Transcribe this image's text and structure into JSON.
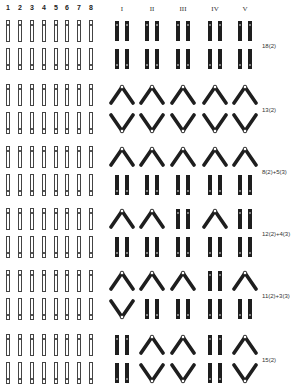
{
  "header": {
    "left_columns": [
      "1",
      "2",
      "3",
      "4",
      "5",
      "6",
      "7",
      "8"
    ],
    "right_columns": [
      "I",
      "II",
      "III",
      "IV",
      "V"
    ]
  },
  "groups": [
    {
      "label": "18(2)",
      "top": [
        "II",
        "II",
        "II",
        "II",
        "II"
      ],
      "bottom": [
        "II",
        "II",
        "II",
        "II",
        "II"
      ],
      "centromere_top": "top",
      "centromere_bottom": "bottom"
    },
    {
      "label": "13(2)",
      "top": [
        "^",
        "^",
        "^",
        "^",
        "^"
      ],
      "bottom": [
        "v",
        "v",
        "v",
        "v",
        "v"
      ],
      "centromere_top": "top",
      "centromere_bottom": "bottom"
    },
    {
      "label": "8(2)+5(3)",
      "top": [
        "^",
        "^",
        "^",
        "^",
        "^"
      ],
      "bottom": [
        "II",
        "II",
        "II",
        "II",
        "II"
      ],
      "centromere_top": "top",
      "centromere_bottom": "bottom"
    },
    {
      "label": "12(2)+4(3)",
      "top": [
        "^",
        "^",
        "II",
        "^",
        "II"
      ],
      "bottom": [
        "II",
        "II",
        "II",
        "II",
        "II"
      ],
      "centromere_top": "top",
      "centromere_bottom": "bottom"
    },
    {
      "label": "11(2)+3(3)",
      "top": [
        "^",
        "^",
        "^",
        "II",
        "^"
      ],
      "bottom": [
        "v",
        "II",
        "II",
        "II",
        "II"
      ],
      "centromere_top": "top",
      "centromere_bottom": "bottom"
    },
    {
      "label": "15(2)",
      "top": [
        "II",
        "^",
        "^",
        "II",
        "^"
      ],
      "bottom": [
        "II",
        "v",
        "v",
        "II",
        "v"
      ],
      "centromere_top": "top",
      "centromere_bottom": "bottom"
    }
  ],
  "colors": {
    "chromosome_dark": "#1e1e1e",
    "chromosome_outline": "#444444",
    "background": "#ffffff"
  }
}
